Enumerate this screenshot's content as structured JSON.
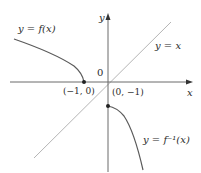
{
  "figure": {
    "axes": {
      "x_label": "x",
      "y_label": "y",
      "origin_label": "0"
    },
    "curves": {
      "f": {
        "label": "y = f(x)",
        "color": "#5a5a5a"
      },
      "f_inverse": {
        "label": "y = f⁻¹(x)",
        "color": "#5a5a5a"
      },
      "identity": {
        "label": "y = x",
        "color": "#b5b5b5"
      }
    },
    "points": {
      "p1": {
        "label": "(−1, 0)"
      },
      "p2": {
        "label": "(0, −1)"
      }
    }
  }
}
